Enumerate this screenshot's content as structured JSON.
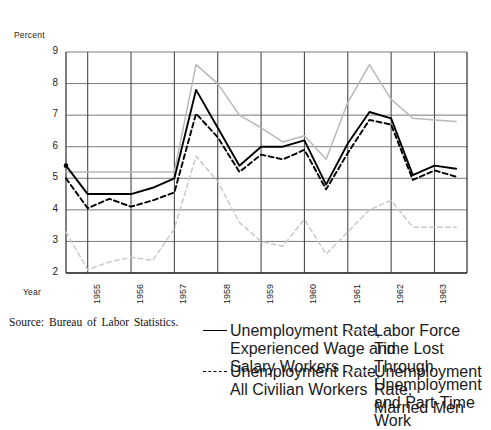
{
  "figure": {
    "y_axis_title": "Percent",
    "x_axis_title": "Year",
    "source_note": "Source: Bureau of Labor Statistics."
  },
  "legend": {
    "entries": [
      {
        "key": "experienced",
        "label": "Unemployment Rate,\nExperienced Wage and\nSalary Workers",
        "style": "solid",
        "color": "#000000"
      },
      {
        "key": "all_civilian",
        "label": "Unemployment Rate,\nAll Civilian Workers",
        "style": "dashed",
        "color": "#000000"
      },
      {
        "key": "time_lost",
        "label": "Labor Force Time Lost\nThrough Unemployment\nand Part-Time Work",
        "style": "solid",
        "color": "#b9b9b9"
      },
      {
        "key": "married_men",
        "label": "Unemployment Rate,\nMarried Men",
        "style": "dashed",
        "color": "#c9c9c9"
      }
    ]
  },
  "chart_data": {
    "type": "line",
    "title": "",
    "xlabel": "Year",
    "ylabel": "Percent",
    "xlim": [
      1954.5,
      1963.75
    ],
    "ylim": [
      2,
      9
    ],
    "yticks": [
      2,
      3,
      4,
      5,
      6,
      7,
      8,
      9
    ],
    "xticks": [
      1955,
      1956,
      1957,
      1958,
      1959,
      1960,
      1961,
      1962,
      1963
    ],
    "xtick_labels": [
      "1955",
      "1956",
      "1957",
      "1958",
      "1959",
      "1960",
      "1961",
      "1962",
      "1963"
    ],
    "grid": true,
    "legend_position": "below",
    "x": [
      1954.5,
      1955.0,
      1955.5,
      1956.0,
      1956.5,
      1957.0,
      1957.5,
      1958.0,
      1958.5,
      1959.0,
      1959.5,
      1960.0,
      1960.5,
      1961.0,
      1961.5,
      1962.0,
      1962.5,
      1963.0,
      1963.5
    ],
    "series": [
      {
        "name": "Unemployment Rate, Experienced Wage and Salary Workers",
        "key": "experienced",
        "style": "solid",
        "color": "#000000",
        "values": [
          5.4,
          4.5,
          4.5,
          4.5,
          4.7,
          5.0,
          7.8,
          6.6,
          5.4,
          6.0,
          6.0,
          6.2,
          4.8,
          6.1,
          7.1,
          6.9,
          5.1,
          5.4,
          5.3
        ]
      },
      {
        "name": "Unemployment Rate, All Civilian Workers",
        "key": "all_civilian",
        "style": "dashed",
        "color": "#000000",
        "values": [
          5.0,
          4.05,
          4.35,
          4.1,
          4.3,
          4.55,
          7.05,
          6.3,
          5.2,
          5.75,
          5.6,
          5.9,
          4.65,
          5.8,
          6.85,
          6.7,
          4.95,
          5.25,
          5.05
        ]
      },
      {
        "name": "Labor Force Time Lost Through Unemployment and Part-Time Work",
        "key": "time_lost",
        "style": "solid",
        "color": "#b9b9b9",
        "values": [
          5.2,
          5.2,
          5.2,
          5.2,
          5.2,
          5.2,
          8.6,
          8.0,
          7.0,
          6.6,
          6.15,
          6.35,
          5.6,
          7.4,
          8.6,
          7.5,
          6.9,
          6.85,
          6.8
        ]
      },
      {
        "name": "Unemployment Rate, Married Men",
        "key": "married_men",
        "style": "dashed",
        "color": "#c9c9c9",
        "values": [
          3.3,
          2.1,
          2.35,
          2.5,
          2.4,
          3.4,
          5.7,
          4.9,
          3.6,
          3.0,
          2.85,
          3.7,
          2.6,
          3.3,
          4.0,
          4.3,
          3.45,
          3.45,
          3.45
        ]
      }
    ]
  }
}
